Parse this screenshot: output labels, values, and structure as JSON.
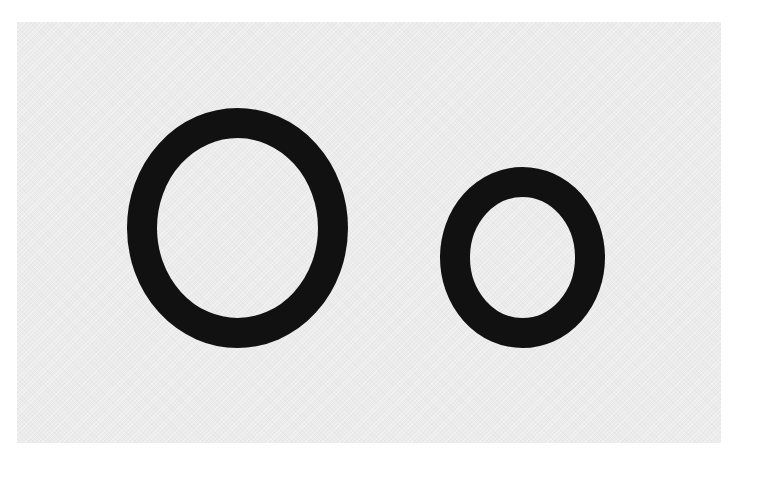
{
  "card": {
    "text": "Oo",
    "uppercase_letter": "O",
    "lowercase_letter": "o",
    "background_color": "#ebebeb",
    "text_color": "#111111"
  }
}
